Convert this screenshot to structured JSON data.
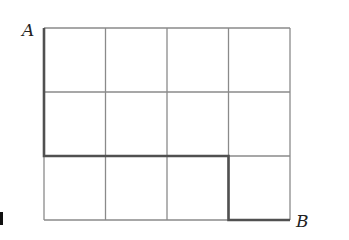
{
  "diagram": {
    "type": "grid-path",
    "grid": {
      "columns": 4,
      "rows": 3,
      "origin": {
        "x": 44,
        "y": 28
      },
      "cell_width": 61.5,
      "cell_height": 64,
      "line_color": "#8a8a8a"
    },
    "path": {
      "color": "#505050",
      "description": "Path from A down 2, right 3, down 1, right 1 to B",
      "points": [
        [
          0,
          0
        ],
        [
          0,
          2
        ],
        [
          3,
          2
        ],
        [
          3,
          3
        ],
        [
          4,
          3
        ]
      ]
    },
    "labels": {
      "start": "A",
      "end": "B"
    },
    "marker": {
      "color": "#111111"
    }
  }
}
